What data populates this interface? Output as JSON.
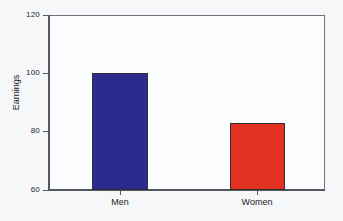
{
  "chart_data": {
    "type": "bar",
    "title": "",
    "subtitle": "",
    "xlabel": "",
    "ylabel": "Earnings",
    "categories": [
      "Men",
      "Women"
    ],
    "values": [
      100,
      83
    ],
    "series": [
      {
        "name": "Earnings",
        "values": [
          100,
          83
        ]
      }
    ],
    "bar_colors": [
      "#2b2b8f",
      "#e33122"
    ],
    "bar_border_color": "#2e2e33",
    "ylim": [
      60,
      120
    ],
    "yticks": [
      60,
      80,
      100,
      120
    ],
    "ytick_labels": [
      "60",
      "80",
      "100",
      "120"
    ],
    "grid": false,
    "legend": null,
    "legend_position": "none",
    "background_color": "#f6f7f9",
    "plot_background_color": "#fbfcfd",
    "axis_color": "#55595f",
    "frame_color": "#6e737b"
  },
  "axes": {
    "y_title": "Earnings",
    "y_labels": {
      "t120": "120",
      "t100": "100",
      "t80": "80",
      "t60": "60"
    },
    "x_labels": {
      "men": "Men",
      "women": "Women"
    }
  },
  "bars": {
    "men": {
      "label": "Men",
      "value": "100",
      "color": "#2b2b8f"
    },
    "women": {
      "label": "Women",
      "value": "83",
      "color": "#e33122"
    }
  }
}
